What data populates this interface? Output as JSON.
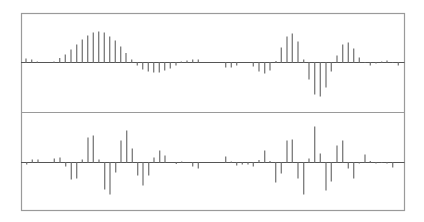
{
  "colors": {
    "background": "#ffffff",
    "frame": "#9a9a9a",
    "baseline": "#555555",
    "stem": "#7a7a7a"
  },
  "chart_data": [
    {
      "type": "bar",
      "subtype": "stem",
      "title": "",
      "xlabel": "",
      "ylabel": "",
      "grid": false,
      "legend": null,
      "panel": "top",
      "x": [
        26,
        31.7,
        37.3,
        54,
        59.7,
        65.3,
        71,
        76.7,
        82.3,
        87.7,
        93.3,
        98.7,
        104.3,
        109.7,
        115.3,
        120.7,
        126,
        131.7,
        137.3,
        142.7,
        148.3,
        153.7,
        159.3,
        164.7,
        170.3,
        176,
        181.3,
        187,
        192.7,
        198.3,
        225.7,
        231.3,
        236.7,
        253.3,
        259,
        264.7,
        270,
        276,
        281.3,
        287,
        292.3,
        298,
        303.7,
        309,
        314.7,
        320.3,
        326,
        331.3,
        337,
        342.7,
        348.3,
        353.7,
        359.3,
        365,
        370.3,
        376,
        381.7,
        387,
        392.7,
        398.3
      ],
      "values": [
        4,
        3,
        1,
        1,
        4.5,
        8,
        13,
        18,
        23,
        27,
        30,
        31,
        30,
        26,
        22,
        16,
        9.5,
        3,
        -3,
        -7,
        -9,
        -10,
        -10,
        -8,
        -6,
        -3,
        1,
        2,
        3,
        3,
        -5,
        -5,
        -3,
        -4,
        -9,
        -11,
        -8,
        1.5,
        15,
        26,
        29,
        21,
        3,
        -17,
        -32,
        -34,
        -25,
        -9,
        7,
        18,
        20,
        14,
        5,
        0.5,
        -3,
        -1,
        1,
        2,
        0.5,
        -3
      ]
    },
    {
      "type": "bar",
      "subtype": "stem",
      "title": "",
      "xlabel": "",
      "ylabel": "",
      "grid": false,
      "legend": null,
      "panel": "bottom",
      "x": [
        26.7,
        32.3,
        38,
        54.3,
        60,
        65.7,
        71.3,
        76.7,
        82.3,
        88,
        93.3,
        99,
        104.7,
        110,
        115.7,
        121,
        126.7,
        132.3,
        137.7,
        143,
        148.7,
        154,
        159.7,
        165,
        176.3,
        181.7,
        192.7,
        198.3,
        225.7,
        231.3,
        236.7,
        242.3,
        248,
        253.3,
        259,
        264.7,
        270,
        275.7,
        281.3,
        287,
        292.3,
        298,
        303.7,
        309,
        314.7,
        320.3,
        326,
        331.3,
        337,
        342.7,
        348.3,
        353.7,
        359.3,
        365,
        370.3,
        376,
        381.7,
        387,
        392.7
      ],
      "values": [
        -2,
        3,
        3,
        4,
        5,
        -4,
        -17,
        -16,
        3,
        25,
        27,
        3,
        -27,
        -32,
        -10,
        22,
        32,
        14,
        -13,
        -23,
        -13,
        5,
        12,
        7,
        -1.5,
        1,
        -4,
        -6,
        6,
        1,
        -3,
        -2,
        -2,
        -4,
        2.5,
        12,
        1.5,
        -20,
        -11,
        22,
        23,
        -16,
        -32,
        4,
        36,
        9,
        -28,
        -19,
        17,
        22,
        -6,
        -16,
        -1,
        8,
        1.5,
        -1,
        0.5,
        -1,
        -5
      ]
    }
  ],
  "layout": {
    "frame": {
      "left": 21,
      "right": 404,
      "top": 13,
      "divider": 112,
      "bottom": 210
    },
    "baselines": {
      "top": 62,
      "bottom": 162
    }
  }
}
